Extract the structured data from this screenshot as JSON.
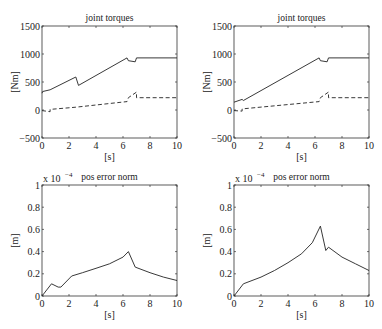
{
  "chart_data": [
    {
      "type": "line",
      "title": "joint torques",
      "xlabel": "[s]",
      "ylabel": "[Nm]",
      "xlim": [
        0,
        10
      ],
      "ylim": [
        -500,
        1500
      ],
      "xticks": [
        "0",
        "2",
        "4",
        "6",
        "8",
        "10"
      ],
      "yticks": [
        "-500",
        "0",
        "500",
        "1000",
        "1500"
      ],
      "series": [
        {
          "name": "joint 1 (solid)",
          "style": "solid",
          "x": [
            0,
            0.05,
            0.6,
            2.5,
            2.7,
            6.3,
            6.4,
            6.9,
            7.0,
            10
          ],
          "y": [
            300,
            330,
            360,
            590,
            440,
            930,
            880,
            860,
            930,
            930
          ]
        },
        {
          "name": "joint 2 (dashed)",
          "style": "dashed",
          "x": [
            0,
            0.6,
            0.6,
            2.5,
            6.3,
            6.4,
            7.0,
            7.0,
            10
          ],
          "y": [
            -10,
            -30,
            10,
            50,
            150,
            220,
            320,
            220,
            220
          ]
        }
      ]
    },
    {
      "type": "line",
      "title": "joint torques",
      "xlabel": "[s]",
      "ylabel": "[Nm]",
      "xlim": [
        0,
        10
      ],
      "ylim": [
        -500,
        1500
      ],
      "xticks": [
        "0",
        "2",
        "4",
        "6",
        "8",
        "10"
      ],
      "yticks": [
        "-500",
        "0",
        "500",
        "1000",
        "1500"
      ],
      "series": [
        {
          "name": "joint 1 (solid)",
          "style": "solid",
          "x": [
            0,
            0.6,
            0.7,
            6.3,
            6.4,
            6.9,
            7.0,
            10
          ],
          "y": [
            140,
            190,
            170,
            930,
            880,
            860,
            930,
            930
          ]
        },
        {
          "name": "joint 2 (dashed)",
          "style": "dashed",
          "x": [
            0,
            0.6,
            0.6,
            6.3,
            6.4,
            7.0,
            7.0,
            10
          ],
          "y": [
            -10,
            -20,
            20,
            150,
            220,
            320,
            220,
            220
          ]
        }
      ]
    },
    {
      "type": "line",
      "title": "pos error norm",
      "xlabel": "[s]",
      "ylabel": "[m]",
      "y_multiplier": "x 10^-4",
      "xlim": [
        0,
        10
      ],
      "ylim": [
        0,
        1
      ],
      "xticks": [
        "0",
        "2",
        "4",
        "6",
        "8",
        "10"
      ],
      "yticks": [
        "0",
        "0.2",
        "0.4",
        "0.6",
        "0.8",
        "1"
      ],
      "series": [
        {
          "name": "pos error norm",
          "style": "solid",
          "x": [
            0,
            0.7,
            1.2,
            1.4,
            2.2,
            3,
            4,
            5,
            6,
            6.4,
            6.9,
            8,
            9,
            10
          ],
          "y": [
            0,
            0.11,
            0.08,
            0.08,
            0.18,
            0.21,
            0.25,
            0.29,
            0.35,
            0.4,
            0.26,
            0.21,
            0.17,
            0.14
          ]
        }
      ]
    },
    {
      "type": "line",
      "title": "pos error norm",
      "xlabel": "[s]",
      "ylabel": "[m]",
      "y_multiplier": "x 10^-4",
      "xlim": [
        0,
        10
      ],
      "ylim": [
        0,
        1
      ],
      "xticks": [
        "0",
        "2",
        "4",
        "6",
        "8",
        "10"
      ],
      "yticks": [
        "0",
        "0.2",
        "0.4",
        "0.6",
        "0.8",
        "1"
      ],
      "series": [
        {
          "name": "pos error norm",
          "style": "solid",
          "x": [
            0,
            0.7,
            2,
            3,
            4,
            5,
            5.8,
            6.4,
            6.8,
            7.0,
            8,
            9,
            10
          ],
          "y": [
            0,
            0.11,
            0.17,
            0.23,
            0.3,
            0.38,
            0.48,
            0.63,
            0.41,
            0.44,
            0.35,
            0.29,
            0.23
          ]
        }
      ]
    }
  ]
}
